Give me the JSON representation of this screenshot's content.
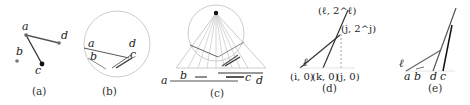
{
  "figure": {
    "panels": [
      {
        "id": "a",
        "caption": "(a)",
        "points": [
          {
            "label": "a",
            "x": 26,
            "y": 35
          },
          {
            "label": "b",
            "x": 17,
            "y": 61
          },
          {
            "label": "c",
            "x": 42,
            "y": 64
          },
          {
            "label": "d",
            "x": 59,
            "y": 43
          }
        ],
        "segments": [
          [
            "a",
            "d"
          ],
          [
            "a",
            "c"
          ]
        ]
      },
      {
        "id": "b",
        "caption": "(b)",
        "labels": [
          "a",
          "b",
          "c",
          "d"
        ]
      },
      {
        "id": "c",
        "caption": "(c)",
        "labels": [
          "a",
          "b",
          "c",
          "d"
        ]
      },
      {
        "id": "d",
        "caption": "(d)",
        "labels": {
          "ell": "ℓ",
          "top": "(ℓ, 2^ℓ)",
          "mid": "(j, 2^j)",
          "i0": "(i, 0)",
          "k0": "(k, 0)",
          "j0": "(j, 0)"
        }
      },
      {
        "id": "e",
        "caption": "(e)",
        "labels": [
          "ℓ",
          "a",
          "b",
          "d",
          "c"
        ]
      }
    ]
  }
}
